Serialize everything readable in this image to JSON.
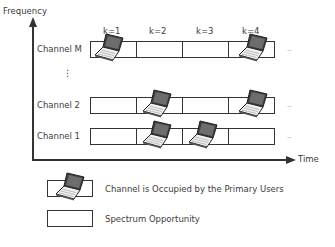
{
  "axes": {
    "y_label": "Frequency",
    "x_label": "Time"
  },
  "slots": [
    "k=1",
    "k=2",
    "k=3",
    "k=4"
  ],
  "channels": [
    {
      "label": "Channel M",
      "occupied": [
        true,
        false,
        false,
        true
      ],
      "trailing": ".."
    },
    {
      "label": "⋮",
      "vertical_ellipsis": true
    },
    {
      "label": "Channel 2",
      "occupied": [
        false,
        true,
        false,
        true
      ],
      "trailing": ".."
    },
    {
      "label": "Channel 1",
      "occupied": [
        false,
        true,
        true,
        false
      ],
      "trailing": ".."
    }
  ],
  "legend": {
    "occupied_label": "Channel is Occupied by the Primary Users",
    "free_label": "Spectrum Opportunity"
  },
  "colors": {
    "line": "#333333",
    "laptop_screen": "#4a4a4a",
    "laptop_body": "#e8e8e8"
  }
}
